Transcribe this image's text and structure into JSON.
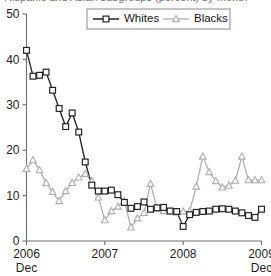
{
  "title_sliver": "Hispanic and Asian subgroups (percent) by month",
  "chart_data": {
    "type": "line",
    "title": "",
    "xlabel": "",
    "ylabel": "",
    "ylim": [
      0,
      50
    ],
    "yticks": [
      0,
      10,
      20,
      30,
      40,
      50
    ],
    "ytick_labels": [
      "0",
      "10",
      "20",
      "30",
      "40",
      "50"
    ],
    "xticks": [
      0,
      12,
      24,
      36
    ],
    "xtick_labels": [
      "2006",
      "2007",
      "2008",
      "2009"
    ],
    "xtick_sublabels": [
      "Dec",
      "",
      "",
      "Dec"
    ],
    "xlim": [
      0,
      36
    ],
    "grid": false,
    "legend_position": "top-center",
    "x": [
      0,
      1,
      2,
      3,
      4,
      5,
      6,
      7,
      8,
      9,
      10,
      11,
      12,
      13,
      14,
      15,
      16,
      17,
      18,
      19,
      20,
      21,
      22,
      23,
      24,
      25,
      26,
      27,
      28,
      29,
      30,
      31,
      32,
      33,
      34,
      35,
      36
    ],
    "series": [
      {
        "name": "Whites",
        "color": "#232323",
        "marker": "square",
        "values": [
          42.0,
          36.3,
          36.5,
          37.2,
          33.2,
          29.2,
          25.2,
          28.2,
          24.0,
          17.4,
          12.3,
          11.0,
          11.0,
          11.2,
          10.2,
          8.5,
          7.2,
          7.6,
          8.6,
          7.0,
          7.3,
          7.4,
          6.6,
          6.5,
          3.2,
          5.8,
          6.3,
          6.5,
          6.6,
          7.0,
          7.1,
          7.0,
          6.6,
          6.2,
          5.6,
          5.2,
          7.0
        ]
      },
      {
        "name": "Blacks",
        "color": "#adadad",
        "marker": "triangle",
        "values": [
          15.9,
          17.8,
          15.6,
          12.8,
          10.8,
          8.8,
          11.0,
          12.8,
          14.0,
          14.8,
          13.2,
          9.6,
          4.6,
          6.6,
          7.6,
          8.8,
          3.0,
          5.0,
          6.2,
          12.6,
          7.2,
          6.6,
          6.6,
          6.3,
          6.5,
          6.6,
          12.0,
          18.6,
          15.2,
          13.2,
          11.8,
          12.2,
          13.3,
          18.6,
          13.4,
          13.4,
          13.4
        ]
      }
    ],
    "legend": [
      {
        "label": "Whites",
        "color": "#232323",
        "marker": "square"
      },
      {
        "label": "Blacks",
        "color": "#adadad",
        "marker": "triangle"
      }
    ]
  }
}
